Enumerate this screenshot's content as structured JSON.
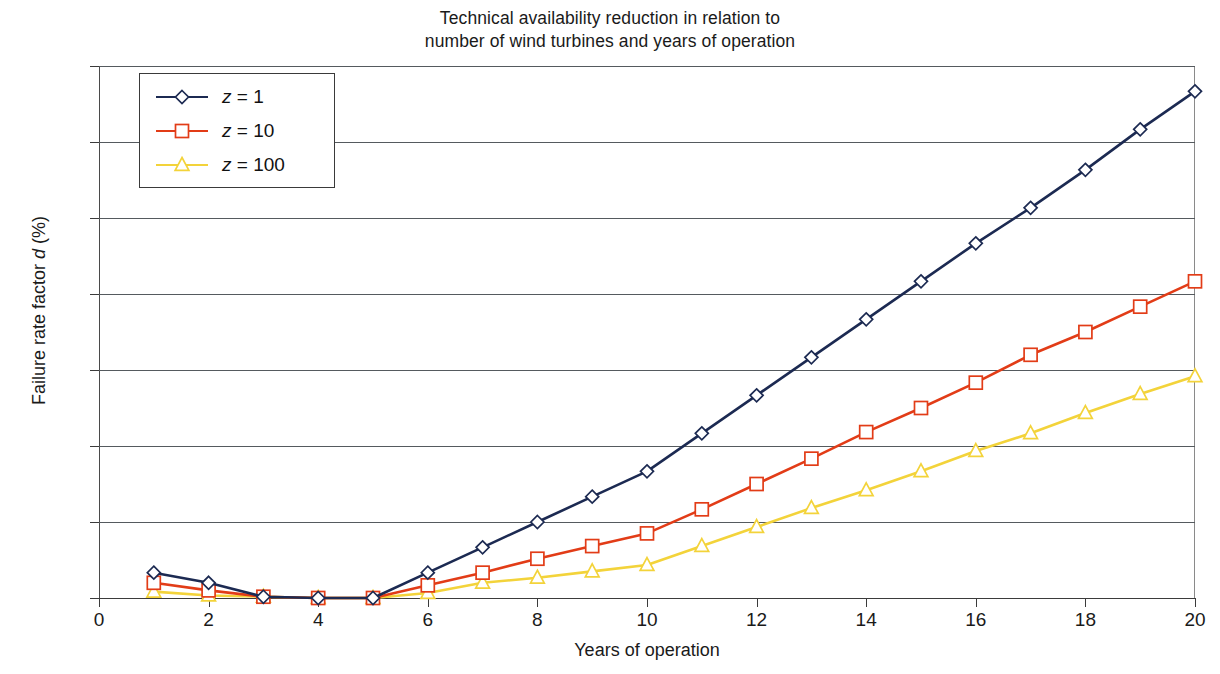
{
  "chart_data": {
    "type": "line",
    "title": "Technical availability reduction in relation to\nnumber of wind turbines and years of operation",
    "xlabel": "Years of operation",
    "ylabel": "Failure rate factor d (%)",
    "ylabel_parts": {
      "pre": "Failure rate factor ",
      "italic": "d",
      "post": " (%)"
    },
    "xlim": [
      0,
      20
    ],
    "ylim": [
      0,
      21
    ],
    "xticks": [
      0,
      2,
      4,
      6,
      8,
      10,
      12,
      14,
      16,
      18,
      20
    ],
    "yticks": [
      0,
      3,
      6,
      9,
      12,
      15,
      18,
      21
    ],
    "grid": "horizontal",
    "legend_position": "upper-left-inside",
    "x": [
      1,
      2,
      3,
      4,
      5,
      6,
      7,
      8,
      9,
      10,
      11,
      12,
      13,
      14,
      15,
      16,
      17,
      18,
      19,
      20
    ],
    "series": [
      {
        "name": "z = 1",
        "legend_label_parts": {
          "italic": "z",
          "rest": " = 1"
        },
        "color": "#1c2a52",
        "marker": "diamond",
        "values": [
          1.0,
          0.6,
          0.05,
          0.0,
          0.0,
          1.0,
          2.0,
          3.0,
          4.0,
          5.0,
          6.5,
          8.0,
          9.5,
          11.0,
          12.5,
          14.0,
          15.4,
          16.9,
          18.5,
          20.0
        ]
      },
      {
        "name": "z = 10",
        "legend_label_parts": {
          "italic": "z",
          "rest": " = 10"
        },
        "color": "#e23c17",
        "marker": "square",
        "values": [
          0.6,
          0.3,
          0.05,
          0.0,
          0.0,
          0.5,
          1.0,
          1.55,
          2.05,
          2.55,
          3.5,
          4.5,
          5.5,
          6.55,
          7.5,
          8.5,
          9.6,
          10.5,
          11.5,
          12.5
        ]
      },
      {
        "name": "z = 100",
        "legend_label_parts": {
          "italic": "z",
          "rest": " = 100"
        },
        "color": "#f3d33a",
        "marker": "triangle",
        "values": [
          0.25,
          0.1,
          0.05,
          0.0,
          0.0,
          0.2,
          0.6,
          0.8,
          1.05,
          1.3,
          2.05,
          2.8,
          3.55,
          4.25,
          5.0,
          5.8,
          6.5,
          7.3,
          8.05,
          8.75
        ]
      }
    ]
  }
}
